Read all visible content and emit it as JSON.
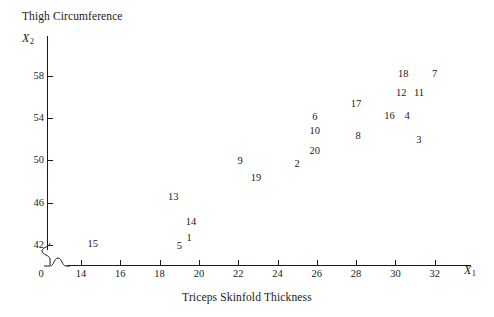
{
  "chart_data": {
    "type": "scatter",
    "title": "Thigh Circumference",
    "xlabel": "Triceps Skinfold Thickness",
    "ylabel": "Thigh Circumference",
    "x_var": "X",
    "x_var_sub": "1",
    "y_var": "X",
    "y_var_sub": "2",
    "origin_label": "0",
    "grid": false,
    "legend": null,
    "axis_break": true,
    "xlim": [
      13.0,
      33.0
    ],
    "ylim": [
      40.8,
      60.2
    ],
    "xticks": [
      14,
      16,
      18,
      20,
      22,
      24,
      26,
      28,
      30,
      32
    ],
    "yticks": [
      42,
      46,
      50,
      54,
      58
    ],
    "xtick_labels": [
      "14",
      "16",
      "18",
      "20",
      "22",
      "24",
      "26",
      "28",
      "30",
      "32"
    ],
    "ytick_labels": [
      "42",
      "46",
      "50",
      "54",
      "58"
    ],
    "point_label_note": "Each plotted case is shown as its case-number text label rather than a marker symbol.",
    "points": [
      {
        "label": "15",
        "x": 14.6,
        "y": 42.1
      },
      {
        "label": "13",
        "x": 18.7,
        "y": 46.5
      },
      {
        "label": "14",
        "x": 19.6,
        "y": 44.2
      },
      {
        "label": "5",
        "x": 19.0,
        "y": 41.9
      },
      {
        "label": "1",
        "x": 19.5,
        "y": 42.7
      },
      {
        "label": "9",
        "x": 22.1,
        "y": 49.9
      },
      {
        "label": "19",
        "x": 22.9,
        "y": 48.3
      },
      {
        "label": "2",
        "x": 25.0,
        "y": 49.7
      },
      {
        "label": "20",
        "x": 25.9,
        "y": 50.9
      },
      {
        "label": "10",
        "x": 25.9,
        "y": 52.8
      },
      {
        "label": "6",
        "x": 25.9,
        "y": 54.1
      },
      {
        "label": "17",
        "x": 28.0,
        "y": 55.3
      },
      {
        "label": "8",
        "x": 28.1,
        "y": 52.3
      },
      {
        "label": "16",
        "x": 29.7,
        "y": 54.2
      },
      {
        "label": "4",
        "x": 30.6,
        "y": 54.2
      },
      {
        "label": "3",
        "x": 31.2,
        "y": 51.9
      },
      {
        "label": "12",
        "x": 30.3,
        "y": 56.4
      },
      {
        "label": "11",
        "x": 31.2,
        "y": 56.4
      },
      {
        "label": "18",
        "x": 30.4,
        "y": 58.2
      },
      {
        "label": "7",
        "x": 32.0,
        "y": 58.2
      }
    ]
  },
  "geometry": {
    "x_px_at_14": 81,
    "x_px_per_unit": 19.65,
    "y_px_at_42": 245,
    "y_px_per_unit": 10.58
  }
}
